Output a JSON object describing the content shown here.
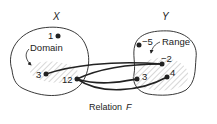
{
  "diagram": {
    "caption": {
      "prefix": "Relation",
      "variable": "F"
    },
    "sets": [
      {
        "id": "X",
        "label": "X",
        "role": "domain-set",
        "annotation": "Domain",
        "points": [
          {
            "id": "x1",
            "label": "1",
            "in_domain": false
          },
          {
            "id": "x3",
            "label": "3",
            "in_domain": true
          },
          {
            "id": "x12",
            "label": "12",
            "in_domain": true
          }
        ]
      },
      {
        "id": "Y",
        "label": "Y",
        "role": "codomain-set",
        "annotation": "Range",
        "points": [
          {
            "id": "y-5",
            "label": "−5",
            "in_range": false
          },
          {
            "id": "y-2",
            "label": "−2",
            "in_range": true
          },
          {
            "id": "y3",
            "label": "3",
            "in_range": true
          },
          {
            "id": "y4",
            "label": "4",
            "in_range": true
          }
        ]
      }
    ],
    "relations": [
      {
        "from": "3",
        "to": "−2"
      },
      {
        "from": "12",
        "to": "−2"
      },
      {
        "from": "12",
        "to": "3"
      },
      {
        "from": "12",
        "to": "4"
      }
    ],
    "colors": {
      "stroke": "#222222",
      "hatch": "#bbbbbb",
      "background": "#ffffff"
    }
  }
}
